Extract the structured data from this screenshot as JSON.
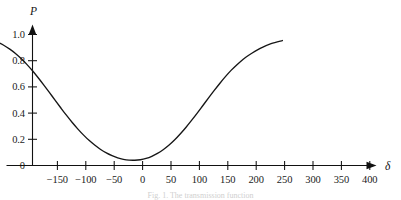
{
  "figure": {
    "background_color": "#ffffff",
    "line_color": "#161616",
    "axis_color": "#111111",
    "text_color": "#1b1b1b",
    "caption_partial": "Fig. 1. The transmission function"
  },
  "chart_data": {
    "type": "line",
    "title": "",
    "subtitle": "",
    "xlabel": "δ",
    "ylabel": "P",
    "xlim": [
      -190,
      440
    ],
    "ylim": [
      0,
      1.06
    ],
    "grid": false,
    "legend": null,
    "x_ticks": [
      -150,
      -100,
      -50,
      0,
      50,
      100,
      150,
      200,
      250,
      300,
      350,
      400
    ],
    "x_tick_labels": [
      "−150",
      "−100",
      "−50",
      "0",
      "50",
      "100",
      "150",
      "200",
      "250",
      "300",
      "350",
      "400"
    ],
    "y_ticks": [
      0,
      0.2,
      0.4,
      0.6,
      0.8,
      1.0
    ],
    "y_tick_labels": [
      "0",
      "0.2",
      "0.4",
      "0.6",
      "0.8",
      "1.0"
    ],
    "x_axis_arrow": true,
    "y_axis_arrow": true,
    "series": [
      {
        "name": "P(δ)",
        "color": "#161616",
        "x": [
          -190,
          -175,
          -160,
          -150,
          -140,
          -130,
          -120,
          -110,
          -100,
          -90,
          -80,
          -70,
          -60,
          -50,
          -40,
          -30,
          -20,
          -10,
          0,
          10,
          20,
          30,
          40,
          50,
          60,
          70,
          80,
          90,
          100,
          110,
          120,
          130,
          140,
          150,
          160,
          170,
          180,
          190,
          200,
          210,
          220,
          230,
          240,
          250,
          260,
          270,
          280,
          290,
          300,
          310,
          320,
          330,
          340,
          350,
          360,
          370,
          380,
          400,
          420,
          440
        ],
        "y": [
          1.0,
          1.0,
          1.0,
          0.999,
          0.998,
          0.997,
          0.995,
          0.991,
          0.986,
          0.979,
          0.969,
          0.956,
          0.938,
          0.916,
          0.888,
          0.855,
          0.816,
          0.772,
          0.723,
          0.67,
          0.614,
          0.556,
          0.497,
          0.439,
          0.382,
          0.328,
          0.278,
          0.232,
          0.19,
          0.154,
          0.122,
          0.096,
          0.075,
          0.058,
          0.047,
          0.041,
          0.04,
          0.044,
          0.054,
          0.07,
          0.092,
          0.12,
          0.154,
          0.194,
          0.24,
          0.29,
          0.344,
          0.4,
          0.458,
          0.516,
          0.573,
          0.628,
          0.68,
          0.728,
          0.77,
          0.808,
          0.84,
          0.892,
          0.93,
          0.954
        ],
        "minimum": {
          "x": 185,
          "y": 0.04
        },
        "plateau_left_value": 1.0,
        "plateau_right_value": 0.99
      }
    ],
    "annotations": []
  }
}
